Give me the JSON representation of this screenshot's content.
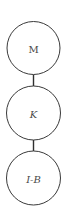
{
  "diagram": {
    "type": "vertical-chain",
    "nodes": [
      {
        "id": "M",
        "label": "M",
        "cx": 33.5,
        "cy": 48,
        "r": 26.5,
        "italic": false
      },
      {
        "id": "K",
        "label": "K",
        "cx": 33.5,
        "cy": 113,
        "r": 27,
        "italic": true
      },
      {
        "id": "I-B",
        "label": "I-B",
        "cx": 33.5,
        "cy": 178,
        "r": 27,
        "italic": true
      }
    ],
    "edges": [
      {
        "from": "M",
        "to": "K",
        "x": 33.5,
        "y1": 74.5,
        "y2": 86
      },
      {
        "from": "K",
        "to": "I-B",
        "x": 33.5,
        "y1": 140,
        "y2": 151
      }
    ],
    "colors": {
      "stroke": "#3a3a3a",
      "text": "#4a4a4a",
      "background": "#ffffff"
    }
  }
}
